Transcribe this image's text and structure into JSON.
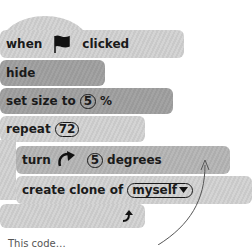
{
  "blocks": {
    "when_flag": {
      "prefix": "when",
      "suffix": "clicked",
      "icon": "green-flag-icon"
    },
    "hide": {
      "label": "hide"
    },
    "set_size": {
      "prefix": "set size to",
      "value": "5",
      "suffix": "%"
    },
    "repeat": {
      "prefix": "repeat",
      "value": "72"
    },
    "turn": {
      "prefix": "turn",
      "icon": "rotate-clockwise-icon",
      "value": "5",
      "suffix": "degrees"
    },
    "create_clone": {
      "prefix": "create clone of",
      "value": "myself",
      "icon": "dropdown-arrow-icon"
    },
    "repeat_end": {
      "icon": "loop-arrow-icon"
    }
  },
  "caption": "This code…"
}
